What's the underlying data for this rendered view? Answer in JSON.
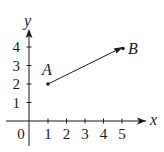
{
  "diagram": {
    "type": "coordinate-plane-vector",
    "colors": {
      "ink": "#1a1a1a",
      "background": "#ffffff"
    },
    "axes": {
      "x_label": "x",
      "y_label": "y",
      "origin_label": "0",
      "x_ticks": [
        "1",
        "2",
        "3",
        "4",
        "5"
      ],
      "y_ticks": [
        "1",
        "2",
        "3",
        "4"
      ]
    },
    "points": [
      {
        "name": "A",
        "label": "A",
        "x": 1,
        "y": 2
      },
      {
        "name": "B",
        "label": "B",
        "x": 5,
        "y": 4
      }
    ],
    "vector": {
      "from": "A",
      "to": "B"
    }
  }
}
